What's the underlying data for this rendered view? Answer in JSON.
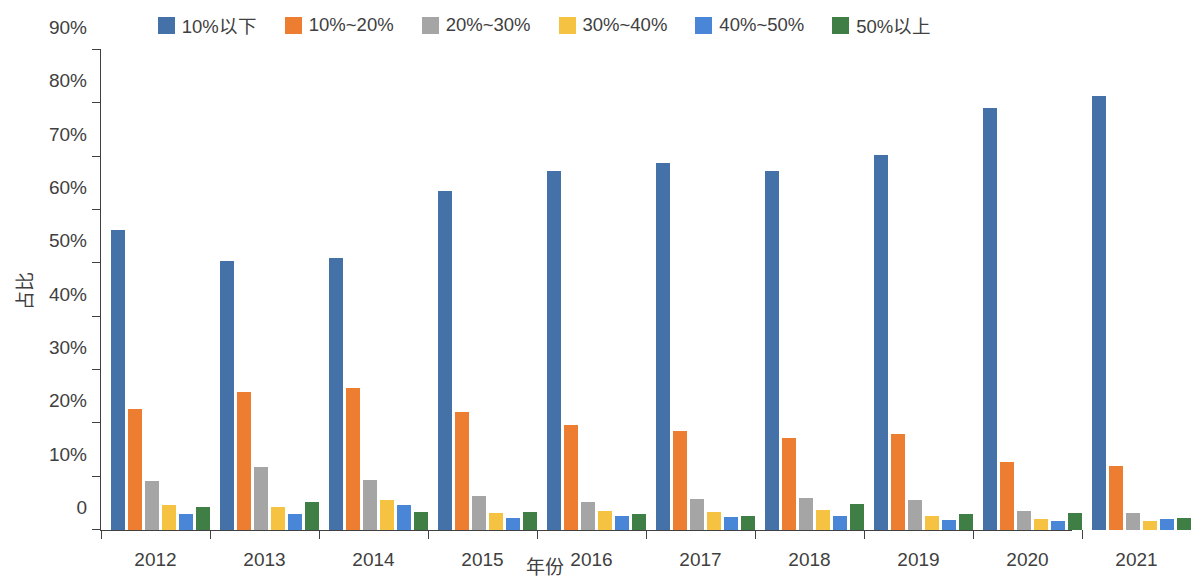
{
  "chart_data": {
    "type": "bar",
    "title": "",
    "xlabel": "年份",
    "ylabel": "占比",
    "ylim": [
      0,
      90
    ],
    "y_unit": "%",
    "grid": false,
    "legend_position": "top-center",
    "y_ticks": [
      "0",
      "10%",
      "20%",
      "30%",
      "40%",
      "50%",
      "60%",
      "70%",
      "80%",
      "90%"
    ],
    "y_tick_values": [
      0,
      10,
      20,
      30,
      40,
      50,
      60,
      70,
      80,
      90
    ],
    "categories": [
      "2012",
      "2013",
      "2014",
      "2015",
      "2016",
      "2017",
      "2018",
      "2019",
      "2020",
      "2021"
    ],
    "series": [
      {
        "name": "10%以下",
        "color": "#4472a8",
        "values": [
          56.3,
          50.4,
          51.0,
          63.6,
          67.3,
          68.9,
          67.3,
          70.4,
          79.2,
          81.3
        ]
      },
      {
        "name": "10%~20%",
        "color": "#ed7d31",
        "values": [
          22.6,
          25.8,
          26.6,
          22.1,
          19.6,
          18.5,
          17.3,
          18.0,
          12.7,
          12.0
        ]
      },
      {
        "name": "20%~30%",
        "color": "#a5a5a5",
        "values": [
          9.1,
          11.8,
          9.4,
          6.3,
          5.2,
          5.8,
          6.0,
          5.7,
          3.6,
          3.1
        ]
      },
      {
        "name": "30%~40%",
        "color": "#f5c242",
        "values": [
          4.6,
          4.4,
          5.6,
          3.1,
          3.5,
          3.3,
          3.7,
          2.6,
          2.0,
          1.7
        ]
      },
      {
        "name": "40%~50%",
        "color": "#4a86d8",
        "values": [
          3.0,
          3.0,
          4.7,
          2.3,
          2.6,
          2.4,
          2.6,
          1.9,
          1.7,
          2.1
        ]
      },
      {
        "name": "50%以上",
        "color": "#3f7e44",
        "values": [
          4.3,
          5.2,
          3.3,
          3.4,
          3.0,
          2.6,
          4.8,
          3.0,
          3.1,
          2.2
        ]
      }
    ]
  }
}
